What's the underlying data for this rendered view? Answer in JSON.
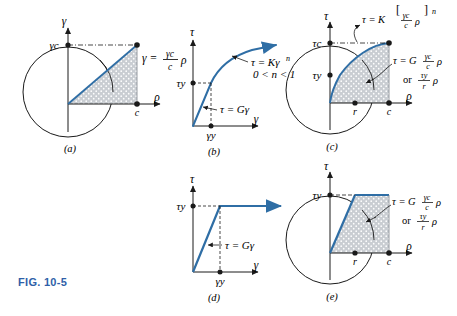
{
  "figure": {
    "label": "FIG. 10-5",
    "label_color": "#2f5fa8",
    "curve_color": "#2f6ea5",
    "axis_color": "#1a1a1a",
    "fill_color": "#c9cdd2",
    "background": "#ffffff"
  },
  "panels": [
    {
      "id": "a",
      "caption": "(a)",
      "type": "cross-section-strain",
      "y_axis_label": "γ",
      "x_axis_label": "ρ",
      "y_tick_label": "γc",
      "x_tick_label": "c",
      "equation_main": "γ =",
      "equation_num": "γc",
      "equation_den": "c",
      "equation_tail": "ρ",
      "description": "Linear shear strain distribution across circular cross section"
    },
    {
      "id": "b",
      "caption": "(b)",
      "type": "stress-strain-curve",
      "y_axis_label": "τ",
      "x_axis_label": "γ",
      "y_tick_label": "τy",
      "x_tick_label": "γy",
      "annotation_power_law": "τ = Kγ",
      "annotation_power_exp": "n",
      "annotation_range": "0 < n < 1",
      "annotation_elastic": "τ = Gγ",
      "description": "Nonlinear strain-hardening stress-strain diagram"
    },
    {
      "id": "c",
      "caption": "(c)",
      "type": "cross-section-stress-nonlinear",
      "y_axis_label": "τ",
      "x_axis_label": "ρ",
      "y_tick_labels": [
        "τc",
        "τy"
      ],
      "x_tick_labels": [
        "r",
        "c"
      ],
      "eq_top_lead": "τ = K",
      "eq_top_num": "γc",
      "eq_top_den": "c",
      "eq_top_rho": "ρ",
      "eq_top_exp": "n",
      "eq_mid_lead": "τ = G",
      "eq_mid_num": "γc",
      "eq_mid_den": "c",
      "eq_mid_rho": "ρ",
      "eq_alt_lead": "or",
      "eq_alt_num": "τy",
      "eq_alt_den": "r",
      "eq_alt_rho": "ρ",
      "description": "Nonlinear shear stress distribution over cross section"
    },
    {
      "id": "d",
      "caption": "(d)",
      "type": "elastic-perfectly-plastic-curve",
      "y_axis_label": "τ",
      "x_axis_label": "γ",
      "y_tick_label": "τy",
      "x_tick_label": "γy",
      "annotation_elastic": "τ = Gγ",
      "description": "Elastic perfectly plastic stress-strain diagram"
    },
    {
      "id": "e",
      "caption": "(e)",
      "type": "cross-section-stress-elastoplastic",
      "y_axis_label": "τ",
      "x_axis_label": "ρ",
      "y_tick_label": "τy",
      "x_tick_labels": [
        "r",
        "c"
      ],
      "eq_mid_lead": "τ = G",
      "eq_mid_num": "γc",
      "eq_mid_den": "c",
      "eq_mid_rho": "ρ",
      "eq_alt_lead": "or",
      "eq_alt_num": "τy",
      "eq_alt_den": "r",
      "eq_alt_rho": "ρ",
      "description": "Elastoplastic shear stress distribution over cross section"
    }
  ]
}
